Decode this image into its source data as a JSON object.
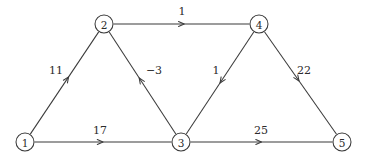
{
  "figure": {
    "width": 367,
    "height": 160,
    "background_color": "#ffffff",
    "stroke_color": "#3a3a3a",
    "text_color": "#2b2b2b"
  },
  "graph_data": {
    "type": "diagram",
    "directed": true,
    "weighted": true,
    "nodes": [
      {
        "id": "1",
        "label": "1",
        "x": 25,
        "y": 142,
        "r": 9
      },
      {
        "id": "2",
        "label": "2",
        "x": 104,
        "y": 24,
        "r": 9
      },
      {
        "id": "3",
        "label": "3",
        "x": 181,
        "y": 142,
        "r": 9
      },
      {
        "id": "4",
        "label": "4",
        "x": 259,
        "y": 24,
        "r": 9
      },
      {
        "id": "5",
        "label": "5",
        "x": 342,
        "y": 142,
        "r": 9
      }
    ],
    "edges": [
      {
        "id": "e-1-2",
        "from": "1",
        "to": "2",
        "weight": "11",
        "label_x": 56,
        "label_y": 70,
        "arrow_t": 0.56
      },
      {
        "id": "e-2-4",
        "from": "2",
        "to": "4",
        "weight": "1",
        "label_x": 182,
        "label_y": 11,
        "arrow_t": 0.52
      },
      {
        "id": "e-3-2",
        "from": "3",
        "to": "2",
        "weight": "-3",
        "label_x": 154,
        "label_y": 70,
        "arrow_t": 0.55
      },
      {
        "id": "e-4-3",
        "from": "4",
        "to": "3",
        "weight": "1",
        "label_x": 216,
        "label_y": 70,
        "arrow_t": 0.5
      },
      {
        "id": "e-4-5",
        "from": "4",
        "to": "5",
        "weight": "22",
        "label_x": 304,
        "label_y": 70,
        "arrow_t": 0.48
      },
      {
        "id": "e-1-3",
        "from": "1",
        "to": "3",
        "weight": "17",
        "label_x": 100,
        "label_y": 130,
        "arrow_t": 0.5
      },
      {
        "id": "e-3-5",
        "from": "3",
        "to": "5",
        "weight": "25",
        "label_x": 261,
        "label_y": 130,
        "arrow_t": 0.5
      }
    ]
  }
}
